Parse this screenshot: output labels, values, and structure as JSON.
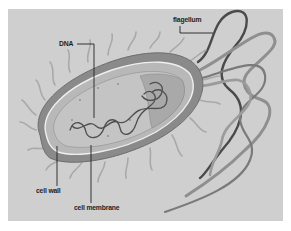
{
  "figure": {
    "background_color": "#cfcfcf",
    "page_color": "#ffffff"
  },
  "labels": {
    "dna": "DNA",
    "flagellum": "flagellum",
    "cell_wall": "cell wall",
    "cell_membrane": "cell membrane"
  },
  "colors": {
    "cell_body": "#8a8a8a",
    "cell_wall": "#b5b5b5",
    "cytoplasm": "#bdbdbd",
    "dna_strand": "#555555",
    "flagella_dark": "#4a4a4a",
    "flagella_light": "#9a9a9a",
    "pili": "#a8a8a8",
    "leader_line": "#222222"
  }
}
